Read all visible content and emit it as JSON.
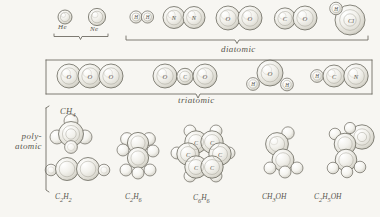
{
  "figure": {
    "style": "hand-drawn pencil illustration",
    "background_color": "#f7f6f2",
    "ink_color": "#5a5850"
  },
  "groups": [
    {
      "id": "monatomic",
      "label": "",
      "bracket": true
    },
    {
      "id": "diatomic",
      "label": "diatomic",
      "bracket": true
    },
    {
      "id": "triatomic",
      "label": "triatomic",
      "bracket": true
    },
    {
      "id": "polyatomic",
      "label_line1": "poly-",
      "label_line2": "atomic",
      "bracket": true
    }
  ],
  "row_monatomic": [
    {
      "name": "helium",
      "formula": "He",
      "caption": "He",
      "atoms": [
        {
          "symbol": "",
          "r": 7
        }
      ]
    },
    {
      "name": "neon",
      "formula": "Ne",
      "caption": "Ne",
      "atoms": [
        {
          "symbol": "",
          "r": 8.5
        }
      ]
    }
  ],
  "row_diatomic": [
    {
      "name": "hydrogen",
      "formula": "H2",
      "atoms": [
        {
          "symbol": "H",
          "r": 6
        },
        {
          "symbol": "H",
          "r": 6
        }
      ]
    },
    {
      "name": "nitrogen",
      "formula": "N2",
      "atoms": [
        {
          "symbol": "N",
          "r": 11
        },
        {
          "symbol": "N",
          "r": 11
        }
      ]
    },
    {
      "name": "oxygen",
      "formula": "O2",
      "atoms": [
        {
          "symbol": "O",
          "r": 12
        },
        {
          "symbol": "O",
          "r": 12
        }
      ]
    },
    {
      "name": "carbon-monoxide",
      "formula": "CO",
      "atoms": [
        {
          "symbol": "C",
          "r": 11
        },
        {
          "symbol": "O",
          "r": 12
        }
      ]
    },
    {
      "name": "hydrogen-chloride",
      "formula": "HCl",
      "atoms": [
        {
          "symbol": "H",
          "r": 6
        },
        {
          "symbol": "Cl",
          "r": 15
        }
      ]
    }
  ],
  "row_triatomic": [
    {
      "name": "ozone",
      "formula": "O3",
      "atoms": [
        {
          "symbol": "O",
          "r": 12
        },
        {
          "symbol": "O",
          "r": 12
        },
        {
          "symbol": "O",
          "r": 12
        }
      ]
    },
    {
      "name": "carbon-dioxide",
      "formula": "CO2",
      "atoms": [
        {
          "symbol": "O",
          "r": 12
        },
        {
          "symbol": "C",
          "r": 8
        },
        {
          "symbol": "O",
          "r": 12
        }
      ]
    },
    {
      "name": "water",
      "formula": "H2O",
      "atoms": [
        {
          "symbol": "H",
          "r": 6
        },
        {
          "symbol": "O",
          "r": 13
        },
        {
          "symbol": "H",
          "r": 6
        }
      ]
    },
    {
      "name": "hydrogen-cyanide",
      "formula": "HCN",
      "atoms": [
        {
          "symbol": "H",
          "r": 6
        },
        {
          "symbol": "C",
          "r": 11
        },
        {
          "symbol": "N",
          "r": 12
        }
      ]
    }
  ],
  "row_polyatomic": [
    {
      "name": "methane",
      "formula": "CH4",
      "caption": "CH4",
      "caption_position": "top"
    },
    {
      "name": "acetylene",
      "formula": "C2H2",
      "caption": "C2H2",
      "caption_position": "bottom"
    },
    {
      "name": "ethane",
      "formula": "C2H6",
      "caption": "C2H6",
      "caption_position": "bottom"
    },
    {
      "name": "benzene",
      "formula": "C6H6",
      "caption": "C6H6",
      "caption_position": "bottom"
    },
    {
      "name": "methanol",
      "formula": "CH3OH",
      "caption": "CH3OH",
      "caption_position": "bottom"
    },
    {
      "name": "ethanol",
      "formula": "C2H5OH",
      "caption": "C2H5OH",
      "caption_position": "bottom"
    }
  ],
  "captions": {
    "he": "He",
    "ne": "Ne",
    "diatomic": "diatomic",
    "triatomic": "triatomic",
    "poly1": "poly-",
    "poly2": "atomic",
    "ch4": "CH",
    "ch4sub": "4",
    "c2h2a": "C",
    "c2h2b": "2",
    "c2h2c": "H",
    "c2h2d": "2",
    "c2h6a": "C",
    "c2h6b": "2",
    "c2h6c": "H",
    "c2h6d": "6",
    "c6h6a": "C",
    "c6h6b": "6",
    "c6h6c": "H",
    "c6h6d": "6",
    "ch3oha": "CH",
    "ch3ohb": "3",
    "ch3ohc": "OH",
    "c2h5oha": "C",
    "c2h5ohb": "2",
    "c2h5ohc": "H",
    "c2h5ohd": "5",
    "c2h5ohe": "OH"
  }
}
